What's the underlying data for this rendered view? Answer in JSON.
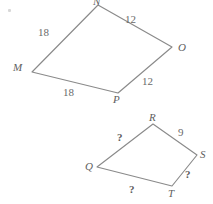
{
  "canvas": {
    "width": 213,
    "height": 204,
    "background_color": "#ffffff",
    "line_color": "#8a8a8a",
    "text_color": "#5e5e5e"
  },
  "artifact": {
    "name": "scan-speck",
    "x": 8,
    "y": 9
  },
  "figures": [
    {
      "id": "quadrilateral-mnop",
      "name": "upper-quadrilateral",
      "vertices": [
        {
          "label": "N",
          "x": 98,
          "y": 5,
          "label_x": 93,
          "label_y": -4
        },
        {
          "label": "O",
          "x": 172,
          "y": 47,
          "label_x": 178,
          "label_y": 42
        },
        {
          "label": "P",
          "x": 118,
          "y": 93,
          "label_x": 113,
          "label_y": 94
        },
        {
          "label": "M",
          "x": 32,
          "y": 72,
          "label_x": 13,
          "label_y": 62
        }
      ],
      "edges": [
        {
          "name": "edge-mn",
          "from": "M",
          "to": "N",
          "length": "18",
          "label_x": 38,
          "label_y": 27
        },
        {
          "name": "edge-no",
          "from": "N",
          "to": "O",
          "length": "12",
          "label_x": 125,
          "label_y": 14
        },
        {
          "name": "edge-op",
          "from": "O",
          "to": "P",
          "length": "12",
          "label_x": 142,
          "label_y": 76
        },
        {
          "name": "edge-pm",
          "from": "P",
          "to": "M",
          "length": "18",
          "label_x": 63,
          "label_y": 87
        }
      ]
    },
    {
      "id": "quadrilateral-qrst",
      "name": "lower-quadrilateral",
      "vertices": [
        {
          "label": "R",
          "x": 153,
          "y": 124,
          "label_x": 149,
          "label_y": 112
        },
        {
          "label": "S",
          "x": 197,
          "y": 155,
          "label_x": 200,
          "label_y": 149
        },
        {
          "label": "T",
          "x": 172,
          "y": 186,
          "label_x": 168,
          "label_y": 188
        },
        {
          "label": "Q",
          "x": 97,
          "y": 167,
          "label_x": 85,
          "label_y": 161
        }
      ],
      "edges": [
        {
          "name": "edge-qr",
          "from": "Q",
          "to": "R",
          "length": "?",
          "label_x": 117,
          "label_y": 132
        },
        {
          "name": "edge-rs",
          "from": "R",
          "to": "S",
          "length": "9",
          "label_x": 178,
          "label_y": 127
        },
        {
          "name": "edge-st",
          "from": "S",
          "to": "T",
          "length": "?",
          "label_x": 185,
          "label_y": 169
        },
        {
          "name": "edge-tq",
          "from": "T",
          "to": "Q",
          "length": "?",
          "label_x": 129,
          "label_y": 184
        }
      ]
    }
  ]
}
